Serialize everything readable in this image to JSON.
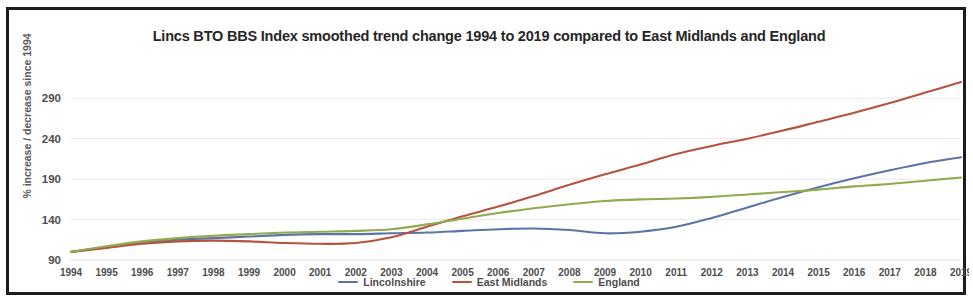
{
  "chart_data": {
    "type": "line",
    "title": "Lincs BTO BBS Index smoothed trend change 1994 to 2019 compared to East Midlands and England",
    "xlabel": "",
    "ylabel": "% increase / decrease since 1994",
    "ylim": [
      90,
      315
    ],
    "yticks": [
      90,
      140,
      190,
      240,
      290
    ],
    "grid": true,
    "legend_position": "bottom",
    "x": [
      1994,
      1995,
      1996,
      1997,
      1998,
      1999,
      2000,
      2001,
      2002,
      2003,
      2004,
      2005,
      2006,
      2007,
      2008,
      2009,
      2010,
      2011,
      2012,
      2013,
      2014,
      2015,
      2016,
      2017,
      2018,
      2019
    ],
    "categories": [
      "1994",
      "1995",
      "1996",
      "1997",
      "1998",
      "1999",
      "2000",
      "2001",
      "2002",
      "2003",
      "2004",
      "2005",
      "2006",
      "2007",
      "2008",
      "2009",
      "2010",
      "2011",
      "2012",
      "2013",
      "2014",
      "2015",
      "2016",
      "2017",
      "2018",
      "2019"
    ],
    "series": [
      {
        "name": "Lincolnshire",
        "color": "#5b74a8",
        "values": [
          100,
          106,
          112,
          115,
          117,
          119,
          121,
          122,
          122,
          123,
          124,
          126,
          128,
          129,
          127,
          123,
          125,
          131,
          142,
          155,
          168,
          180,
          191,
          201,
          210,
          217
        ]
      },
      {
        "name": "East Midlands",
        "color": "#b5533f",
        "values": [
          100,
          105,
          110,
          113,
          114,
          113,
          111,
          110,
          111,
          118,
          131,
          144,
          156,
          169,
          183,
          196,
          208,
          221,
          231,
          240,
          250,
          261,
          272,
          284,
          297,
          310
        ]
      },
      {
        "name": "England",
        "color": "#90aa4c",
        "values": [
          100,
          107,
          113,
          117,
          120,
          122,
          124,
          125,
          126,
          128,
          134,
          141,
          148,
          154,
          159,
          163,
          165,
          166,
          168,
          171,
          174,
          177,
          181,
          184,
          188,
          192
        ]
      }
    ]
  },
  "legend": {
    "items": [
      {
        "label": "Lincolnshire",
        "color": "#5b74a8"
      },
      {
        "label": "East Midlands",
        "color": "#b5533f"
      },
      {
        "label": "England",
        "color": "#90aa4c"
      }
    ]
  }
}
